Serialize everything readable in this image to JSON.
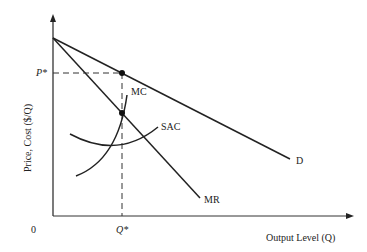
{
  "diagram": {
    "title": "",
    "y_axis_label": "Price, Cost ($/Q)",
    "x_axis_label": "Output Level (Q)",
    "origin_label": "0",
    "p_star_label": "P*",
    "q_star_label": "Q*",
    "curves": {
      "demand": "D",
      "marginal_revenue": "MR",
      "marginal_cost": "MC",
      "short_run_average_cost": "SAC"
    }
  }
}
